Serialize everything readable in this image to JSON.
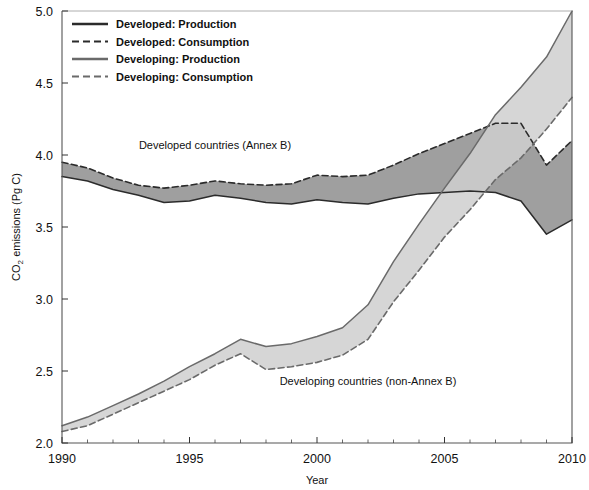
{
  "chart_data": {
    "type": "area",
    "title": "",
    "xlabel": "Year",
    "ylabel_parts": {
      "pre": "CO",
      "sub": "2",
      "post": " emissions (Pg C)"
    },
    "ylabel": "CO2 emissions (Pg C)",
    "xlim": [
      1990,
      2010
    ],
    "ylim": [
      2.0,
      5.0
    ],
    "xticks": [
      1990,
      1995,
      2000,
      2005,
      2010
    ],
    "xtick_labels": [
      "1990",
      "1995",
      "2000",
      "2005",
      "2010"
    ],
    "yticks": [
      2.0,
      2.5,
      3.0,
      3.5,
      4.0,
      4.5,
      5.0
    ],
    "ytick_labels": [
      "2.0",
      "2.5",
      "3.0",
      "3.5",
      "4.0",
      "4.5",
      "5.0"
    ],
    "minor_xtick_step": 1,
    "grid": false,
    "legend_position": "top-left",
    "x": [
      1990,
      1991,
      1992,
      1993,
      1994,
      1995,
      1996,
      1997,
      1998,
      1999,
      2000,
      2001,
      2002,
      2003,
      2004,
      2005,
      2006,
      2007,
      2008,
      2009,
      2010
    ],
    "series": [
      {
        "name": "Developed: Production",
        "style": "solid",
        "color": "#2b2b2b",
        "values": [
          3.85,
          3.82,
          3.76,
          3.72,
          3.67,
          3.68,
          3.72,
          3.7,
          3.67,
          3.66,
          3.69,
          3.67,
          3.66,
          3.7,
          3.73,
          3.74,
          3.75,
          3.74,
          3.68,
          3.45,
          3.55
        ]
      },
      {
        "name": "Developed: Consumption",
        "style": "dashed",
        "color": "#2b2b2b",
        "values": [
          3.95,
          3.91,
          3.84,
          3.79,
          3.77,
          3.79,
          3.82,
          3.8,
          3.79,
          3.8,
          3.86,
          3.85,
          3.86,
          3.93,
          4.01,
          4.08,
          4.15,
          4.22,
          4.22,
          3.93,
          4.1
        ]
      },
      {
        "name": "Developing: Production",
        "style": "solid",
        "color": "#6a6a6a",
        "values": [
          2.12,
          2.18,
          2.26,
          2.34,
          2.43,
          2.53,
          2.62,
          2.72,
          2.67,
          2.69,
          2.74,
          2.8,
          2.96,
          3.26,
          3.52,
          3.77,
          4.01,
          4.28,
          4.47,
          4.68,
          5.0
        ]
      },
      {
        "name": "Developing: Consumption",
        "style": "dashed",
        "color": "#6a6a6a",
        "values": [
          2.08,
          2.12,
          2.2,
          2.28,
          2.36,
          2.44,
          2.54,
          2.62,
          2.51,
          2.53,
          2.56,
          2.61,
          2.72,
          2.98,
          3.2,
          3.43,
          3.62,
          3.83,
          3.98,
          4.18,
          4.4
        ]
      }
    ],
    "bands": [
      {
        "name": "Developed band",
        "upper": "Developed: Consumption",
        "lower": "Developed: Production",
        "fill": "#8e8e8e"
      },
      {
        "name": "Developing band",
        "upper": "Developing: Production",
        "lower": "Developing: Consumption",
        "fill": "#cfcfcf"
      }
    ],
    "annotations": [
      {
        "text": "Developed countries (Annex B)",
        "x": 1996.0,
        "y": 4.04
      },
      {
        "text": "Developing countries (non-Annex B)",
        "x": 2002.0,
        "y": 2.4
      }
    ],
    "legend": [
      {
        "label": "Developed: Production",
        "style": "solid",
        "color": "#2b2b2b"
      },
      {
        "label": "Developed: Consumption",
        "style": "dashed",
        "color": "#2b2b2b"
      },
      {
        "label": "Developing: Production",
        "style": "solid",
        "color": "#6a6a6a"
      },
      {
        "label": "Developing: Consumption",
        "style": "dashed",
        "color": "#6a6a6a"
      }
    ]
  }
}
